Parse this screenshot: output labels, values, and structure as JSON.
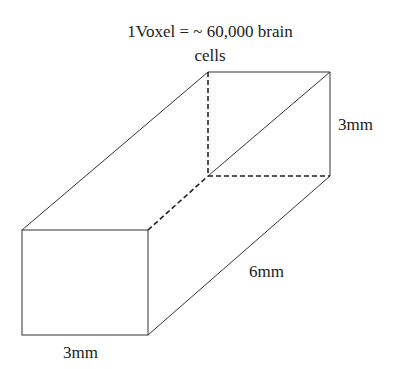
{
  "title_line1": "1Voxel = ~ 60,000 brain",
  "title_line2": "cells",
  "labels": {
    "height": "3mm",
    "depth": "6mm",
    "width": "3mm"
  },
  "colors": {
    "line": "#333333",
    "background": "#ffffff"
  }
}
